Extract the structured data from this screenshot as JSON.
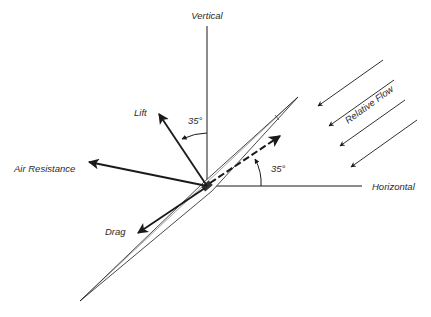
{
  "diagram": {
    "labels": {
      "vertical": "Vertical",
      "horizontal": "Horizontal",
      "lift": "Lift",
      "air_resistance": "Air Resistance",
      "drag": "Drag",
      "relative_flow": "Relative Flow",
      "angle_lift": "35°",
      "angle_attack": "35°"
    },
    "colors": {
      "line": "#1a1a1a",
      "background": "#ffffff"
    }
  }
}
